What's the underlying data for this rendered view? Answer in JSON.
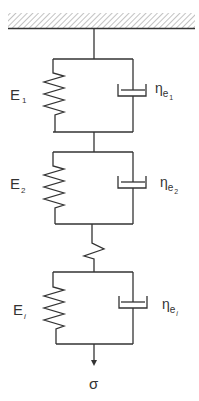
{
  "diagram": {
    "colors": {
      "line": "#333333",
      "hatch": "#9a9a9a",
      "background": "#ffffff"
    },
    "support": {
      "label": "fixed-support",
      "hatched": true
    },
    "elements": [
      {
        "type": "kelvin-voigt",
        "spring_label": "E",
        "spring_sub": "1",
        "dashpot_label": "η",
        "dashpot_sub": "e",
        "dashpot_subsub": "1"
      },
      {
        "type": "kelvin-voigt",
        "spring_label": "E",
        "spring_sub": "2",
        "dashpot_label": "η",
        "dashpot_sub": "e",
        "dashpot_subsub": "2"
      },
      {
        "type": "spring",
        "spring_label": ""
      },
      {
        "type": "kelvin-voigt",
        "spring_label": "E",
        "spring_sub": "i",
        "dashpot_label": "η",
        "dashpot_sub": "e",
        "dashpot_subsub": "i"
      }
    ],
    "load": {
      "symbol": "σ",
      "direction": "down"
    }
  }
}
